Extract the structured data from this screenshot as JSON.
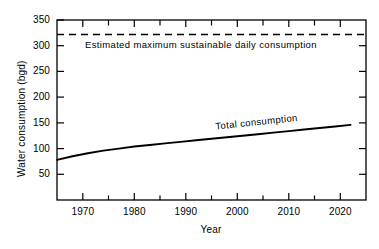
{
  "chart_data": {
    "type": "line",
    "title": "",
    "xlabel": "Year",
    "ylabel": "Water consumption (bgd)",
    "xlim": [
      1965,
      2025
    ],
    "ylim": [
      0,
      350
    ],
    "grid": false,
    "legend_position": "inline-annotations",
    "x_ticks_major": [
      1970,
      1980,
      1990,
      2000,
      2010,
      2020
    ],
    "x_tick_labels": [
      "1970",
      "1980",
      "1990",
      "2000",
      "2010",
      "2020"
    ],
    "x_ticks_minor": [
      1975,
      1985,
      1995,
      2005,
      2015
    ],
    "y_ticks_major": [
      50,
      100,
      150,
      200,
      250,
      300,
      350
    ],
    "y_tick_labels": [
      "50",
      "100",
      "150",
      "200",
      "250",
      "300",
      "350"
    ],
    "series": [
      {
        "name": "Total consumption",
        "style": "solid",
        "annotation": "Total consumption",
        "x": [
          1965,
          1968,
          1971,
          1974,
          1977,
          1980,
          1983,
          1986,
          1989,
          1992,
          1995,
          1998,
          2001,
          2004,
          2007,
          2010,
          2013,
          2016,
          2019,
          2022
        ],
        "values": [
          78,
          85,
          91,
          96,
          100,
          104,
          107,
          110,
          113,
          116,
          119,
          122,
          125,
          128,
          131,
          134,
          137,
          140,
          143,
          146
        ]
      },
      {
        "name": "Estimated maximum sustainable daily consumption",
        "style": "dashed",
        "annotation": "Estimated maximum sustainable daily consumption",
        "value": 322,
        "x": [
          1965,
          2025
        ],
        "values": [
          322,
          322
        ]
      }
    ]
  },
  "axis": {
    "units": "bgd",
    "frame": "box"
  }
}
